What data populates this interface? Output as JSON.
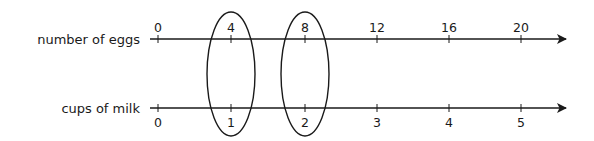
{
  "diagram": {
    "type": "double number line",
    "lines": [
      {
        "label": "number of eggs",
        "ticks": [
          "0",
          "4",
          "8",
          "12",
          "16",
          "20"
        ],
        "tick_label_position": "above"
      },
      {
        "label": "cups of milk",
        "ticks": [
          "0",
          "1",
          "2",
          "3",
          "4",
          "5"
        ],
        "tick_label_position": "below"
      }
    ],
    "highlighted_pairs": [
      {
        "eggs": "4",
        "milk": "1"
      },
      {
        "eggs": "8",
        "milk": "2"
      }
    ],
    "colors": {
      "line": "#1a1a1a",
      "background": "#ffffff"
    }
  }
}
